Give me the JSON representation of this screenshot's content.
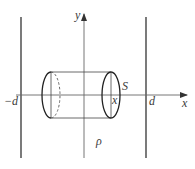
{
  "diagram": {
    "type": "physics-figure",
    "axes": {
      "x_label": "x",
      "y_label": "y"
    },
    "planes": [
      {
        "name": "left-plane",
        "label": "−d"
      },
      {
        "name": "right-plane",
        "label": "d"
      }
    ],
    "gaussian_cylinder": {
      "area_label": "S",
      "end_position_label": "x"
    },
    "charge_density_label": "ρ",
    "colors": {
      "stroke": "#333333",
      "axis": "#555555",
      "background": "#ffffff"
    }
  }
}
